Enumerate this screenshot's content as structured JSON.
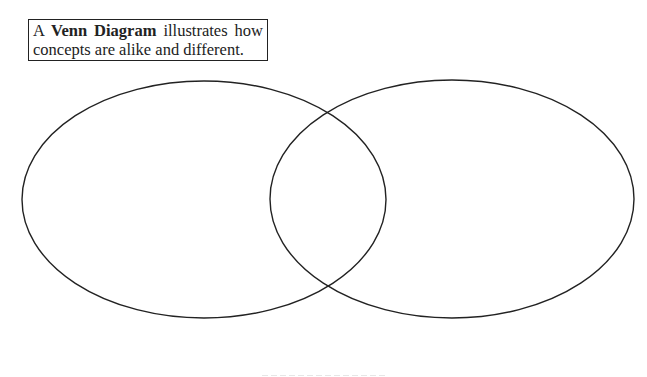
{
  "caption": {
    "prefix": "A ",
    "term": "Venn Diagram",
    "line1_suffix": " illustrates how",
    "line2": "concepts are alike and different."
  },
  "diagram": {
    "type": "venn",
    "set_count": 2,
    "stroke_color": "#222222",
    "background_color": "#ffffff",
    "sets": [
      {
        "name": "left-circle",
        "label": "",
        "cx": 204,
        "cy": 199.5,
        "rx": 182,
        "ry": 118.5
      },
      {
        "name": "right-circle",
        "label": "",
        "cx": 452,
        "cy": 199,
        "rx": 182,
        "ry": 119
      }
    ]
  }
}
